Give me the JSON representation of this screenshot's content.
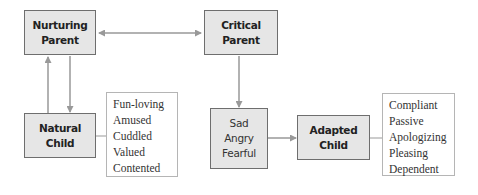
{
  "diagram": {
    "nurturing_parent": {
      "line1": "Nurturing",
      "line2": "Parent"
    },
    "critical_parent": {
      "line1": "Critical",
      "line2": "Parent"
    },
    "natural_child": {
      "line1": "Natural",
      "line2": "Child"
    },
    "adapted_child": {
      "line1": "Adapted",
      "line2": "Child"
    },
    "emotions": {
      "items": [
        "Sad",
        "Angry",
        "Fearful"
      ]
    },
    "natural_child_traits": {
      "items": [
        "Fun-loving",
        "Amused",
        "Cuddled",
        "Valued",
        "Contented"
      ]
    },
    "adapted_child_traits": {
      "items": [
        "Compliant",
        "Passive",
        "Apologizing",
        "Pleasing",
        "Dependent"
      ]
    },
    "colors": {
      "box_fill": "#e6e6e6",
      "box_border": "#6e6e6e",
      "arrow": "#999999",
      "list_border": "#b5b5b5"
    }
  }
}
